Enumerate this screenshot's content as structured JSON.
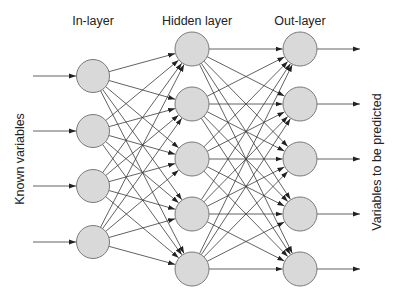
{
  "diagram": {
    "type": "neural-network",
    "layer_labels": {
      "input": "In-layer",
      "hidden": "Hidden layer",
      "output": "Out-layer"
    },
    "side_labels": {
      "left": "Known variables",
      "right": "Variables to be predicted"
    },
    "colors": {
      "node_fill": "#d9d9d9",
      "node_stroke": "#7a7a7a",
      "edge": "#3a3a3a",
      "text": "#222222"
    },
    "layers": [
      {
        "name": "input",
        "x": 93,
        "r": 16.5,
        "nodes_y": [
          76,
          131,
          186,
          242
        ]
      },
      {
        "name": "hidden",
        "x": 192,
        "r": 17,
        "nodes_y": [
          49,
          104,
          159,
          214,
          269
        ]
      },
      {
        "name": "output",
        "x": 300,
        "r": 17,
        "nodes_y": [
          49,
          104,
          159,
          214,
          269
        ]
      }
    ],
    "connectivity": "fully-connected",
    "input_arrows": {
      "x_start": 33
    },
    "output_arrows": {
      "x_end": 360
    }
  }
}
